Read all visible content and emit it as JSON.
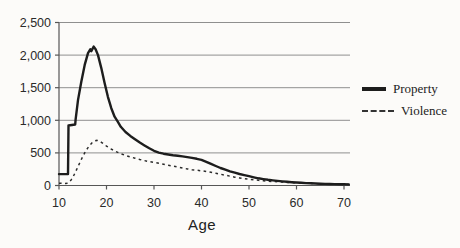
{
  "figure": {
    "background": "#fcfbf9",
    "grid_color": "#8f8f8f",
    "axis_color": "#565656",
    "text_color": "#2a2a2a",
    "property_line_color": "#1d1d1d",
    "violence_line_color": "#2b2b2b"
  },
  "chart_data": {
    "type": "line",
    "title": "",
    "xlabel": "Age",
    "ylabel": "",
    "xlim": [
      10,
      71
    ],
    "ylim": [
      0,
      2500
    ],
    "grid": "horizontal-only",
    "legend_position": "right-outside",
    "x_ticks": [
      {
        "value": 10,
        "label": "10"
      },
      {
        "value": 20,
        "label": "20"
      },
      {
        "value": 30,
        "label": "30"
      },
      {
        "value": 40,
        "label": "40"
      },
      {
        "value": 50,
        "label": "50"
      },
      {
        "value": 60,
        "label": "60"
      },
      {
        "value": 70,
        "label": "70"
      }
    ],
    "y_ticks": [
      {
        "value": 0,
        "label": "0"
      },
      {
        "value": 500,
        "label": "500"
      },
      {
        "value": 1000,
        "label": "1,000"
      },
      {
        "value": 1500,
        "label": "1,500"
      },
      {
        "value": 2000,
        "label": "2,000"
      },
      {
        "value": 2500,
        "label": "2,500"
      }
    ],
    "series": [
      {
        "name": "Property",
        "line_style": "solid",
        "points": [
          [
            10,
            175
          ],
          [
            11.9,
            175
          ],
          [
            12,
            920
          ],
          [
            13.4,
            935
          ],
          [
            13.5,
            1010
          ],
          [
            14,
            1310
          ],
          [
            14.7,
            1590
          ],
          [
            15.4,
            1850
          ],
          [
            16.1,
            2030
          ],
          [
            16.6,
            2090
          ],
          [
            16.8,
            2060
          ],
          [
            17.3,
            2130
          ],
          [
            17.7,
            2090
          ],
          [
            18.2,
            2000
          ],
          [
            18.9,
            1800
          ],
          [
            19.6,
            1570
          ],
          [
            20.3,
            1360
          ],
          [
            21,
            1185
          ],
          [
            21.7,
            1055
          ],
          [
            22.4,
            975
          ],
          [
            23,
            900
          ],
          [
            24,
            820
          ],
          [
            25,
            760
          ],
          [
            26,
            710
          ],
          [
            27,
            660
          ],
          [
            28,
            615
          ],
          [
            29,
            570
          ],
          [
            30,
            532
          ],
          [
            31,
            505
          ],
          [
            32,
            488
          ],
          [
            33,
            475
          ],
          [
            34,
            464
          ],
          [
            35,
            455
          ],
          [
            36,
            446
          ],
          [
            37,
            436
          ],
          [
            38,
            424
          ],
          [
            39,
            409
          ],
          [
            40,
            392
          ],
          [
            41,
            363
          ],
          [
            42,
            331
          ],
          [
            43,
            299
          ],
          [
            44,
            269
          ],
          [
            45,
            242
          ],
          [
            46,
            217
          ],
          [
            47,
            196
          ],
          [
            48,
            177
          ],
          [
            49,
            159
          ],
          [
            50,
            142
          ],
          [
            51,
            126
          ],
          [
            52,
            111
          ],
          [
            53,
            98
          ],
          [
            54,
            87
          ],
          [
            55,
            78
          ],
          [
            56,
            70
          ],
          [
            57,
            63
          ],
          [
            58,
            57
          ],
          [
            59,
            51
          ],
          [
            60,
            46
          ],
          [
            61,
            41
          ],
          [
            62,
            37
          ],
          [
            63,
            33
          ],
          [
            64,
            30
          ],
          [
            65,
            27
          ],
          [
            66,
            25
          ],
          [
            67,
            23
          ],
          [
            68,
            21
          ],
          [
            69,
            19
          ],
          [
            70,
            18
          ],
          [
            71,
            17
          ]
        ]
      },
      {
        "name": "Violence",
        "line_style": "dashed",
        "points": [
          [
            10,
            35
          ],
          [
            11,
            30
          ],
          [
            11.8,
            35
          ],
          [
            12.5,
            80
          ],
          [
            13,
            140
          ],
          [
            13.5,
            210
          ],
          [
            14,
            290
          ],
          [
            14.5,
            370
          ],
          [
            15,
            445
          ],
          [
            15.5,
            510
          ],
          [
            16,
            570
          ],
          [
            16.5,
            620
          ],
          [
            17,
            658
          ],
          [
            17.5,
            682
          ],
          [
            18,
            692
          ],
          [
            18.5,
            680
          ],
          [
            19,
            658
          ],
          [
            19.5,
            632
          ],
          [
            20,
            605
          ],
          [
            21,
            558
          ],
          [
            22,
            520
          ],
          [
            23,
            488
          ],
          [
            24,
            461
          ],
          [
            25,
            438
          ],
          [
            26,
            418
          ],
          [
            27,
            399
          ],
          [
            28,
            382
          ],
          [
            29,
            367
          ],
          [
            30,
            354
          ],
          [
            31,
            341
          ],
          [
            32,
            327
          ],
          [
            33,
            312
          ],
          [
            34,
            297
          ],
          [
            35,
            283
          ],
          [
            36,
            269
          ],
          [
            37,
            255
          ],
          [
            38,
            243
          ],
          [
            39,
            234
          ],
          [
            40,
            226
          ],
          [
            41,
            214
          ],
          [
            42,
            202
          ],
          [
            43,
            189
          ],
          [
            44,
            174
          ],
          [
            45,
            158
          ],
          [
            46,
            142
          ],
          [
            47,
            128
          ],
          [
            48,
            116
          ],
          [
            49,
            105
          ],
          [
            50,
            95
          ],
          [
            51,
            87
          ],
          [
            52,
            79
          ],
          [
            53,
            72
          ],
          [
            54,
            66
          ],
          [
            55,
            61
          ],
          [
            56,
            56
          ],
          [
            57,
            52
          ],
          [
            58,
            48
          ],
          [
            59,
            44
          ],
          [
            60,
            41
          ],
          [
            61,
            38
          ],
          [
            62,
            35
          ],
          [
            63,
            32
          ],
          [
            64,
            29
          ],
          [
            65,
            27
          ],
          [
            66,
            24
          ],
          [
            67,
            22
          ],
          [
            68,
            20
          ],
          [
            69,
            19
          ],
          [
            70,
            17
          ],
          [
            71,
            16
          ]
        ]
      }
    ]
  }
}
